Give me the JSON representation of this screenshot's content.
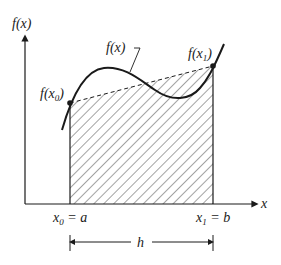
{
  "figure": {
    "type": "trapezoidal-rule-illustration",
    "y_axis_label": "f(x)",
    "x_axis_label": "x",
    "curve_label": "f(x)",
    "point_left_label": {
      "base": "f(x",
      "sub": "0",
      "close": ")"
    },
    "point_right_label": {
      "base": "f(x",
      "sub": "1",
      "close": ")"
    },
    "x0_label": {
      "var": "x",
      "sub": "0",
      "rest": " = a"
    },
    "x1_label": {
      "var": "x",
      "sub": "1",
      "rest": " = b"
    },
    "width_label": "h",
    "colors": {
      "line": "#1a1a1a",
      "hatch": "#333333",
      "background": "#ffffff"
    }
  }
}
